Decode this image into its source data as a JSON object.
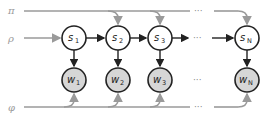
{
  "diagram": {
    "type": "graphical-model",
    "params": [
      {
        "id": "pi",
        "label": "π"
      },
      {
        "id": "rho",
        "label": "ρ"
      },
      {
        "id": "phi",
        "label": "φ"
      }
    ],
    "state_nodes": [
      {
        "id": "s1",
        "label": "s",
        "sub": "1"
      },
      {
        "id": "s2",
        "label": "s",
        "sub": "2"
      },
      {
        "id": "s3",
        "label": "s",
        "sub": "3"
      },
      {
        "id": "sN",
        "label": "s",
        "sub": "N"
      }
    ],
    "observed_nodes": [
      {
        "id": "w1",
        "label": "w",
        "sub": "1"
      },
      {
        "id": "w2",
        "label": "w",
        "sub": "2"
      },
      {
        "id": "w3",
        "label": "w",
        "sub": "3"
      },
      {
        "id": "wN",
        "label": "w",
        "sub": "N"
      }
    ],
    "ellipsis": "···",
    "colors": {
      "param_line": "#9a9a9a",
      "edge": "#222222",
      "observed_fill": "#d6d6d6",
      "latent_fill": "#ffffff"
    }
  }
}
